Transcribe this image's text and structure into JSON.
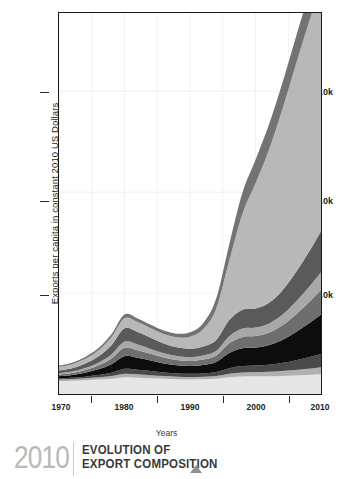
{
  "footer": {
    "year": "2010",
    "title_line1": "EVOLUTION OF",
    "title_line2": "EXPORT COMPOSITION",
    "marker": "triangle-up"
  },
  "chart_data": {
    "type": "area",
    "stacked": true,
    "title": "",
    "xlabel": "Years",
    "ylabel": "Exports per capita in constant 2010 US Dollars",
    "xlim": [
      1970,
      2010
    ],
    "ylim": [
      0,
      7550
    ],
    "grid": true,
    "legend": "none",
    "x_ticks": [
      "1970",
      "1980",
      "1990",
      "2000",
      "2010"
    ],
    "x_tick_values": [
      1970,
      1980,
      1990,
      2000,
      2010
    ],
    "x_minor_ticks": [
      1975,
      1985,
      1995,
      2005
    ],
    "y_ticks": [
      "2.0k",
      "4.0k",
      "6.0k"
    ],
    "y_tick_values": [
      2000,
      4000,
      6000
    ],
    "x": [
      1970,
      1972,
      1974,
      1976,
      1978,
      1980,
      1982,
      1984,
      1986,
      1988,
      1990,
      1992,
      1994,
      1996,
      1998,
      2000,
      2002,
      2004,
      2006,
      2008,
      2010
    ],
    "series": [
      {
        "name": "layer-1-bottom-light",
        "color": "#e6e6e6",
        "values": [
          255,
          262,
          272,
          285,
          300,
          330,
          322,
          312,
          300,
          292,
          288,
          290,
          300,
          330,
          345,
          350,
          352,
          358,
          368,
          378,
          392
        ]
      },
      {
        "name": "layer-2-mid-gray",
        "color": "#b0b0b0",
        "values": [
          30,
          33,
          38,
          45,
          55,
          72,
          68,
          62,
          56,
          52,
          50,
          52,
          58,
          72,
          80,
          84,
          88,
          96,
          108,
          122,
          140
        ]
      },
      {
        "name": "layer-3-dark-band",
        "color": "#4a4a4a",
        "values": [
          22,
          26,
          34,
          46,
          66,
          96,
          90,
          80,
          70,
          64,
          62,
          66,
          78,
          110,
          128,
          130,
          140,
          160,
          190,
          225,
          262
        ]
      },
      {
        "name": "layer-4-black",
        "color": "#0d0d0d",
        "values": [
          46,
          56,
          78,
          112,
          170,
          252,
          236,
          208,
          180,
          162,
          156,
          168,
          200,
          300,
          352,
          356,
          386,
          452,
          548,
          660,
          782
        ]
      },
      {
        "name": "layer-5-medium-gray",
        "color": "#6e6e6e",
        "values": [
          34,
          40,
          54,
          76,
          112,
          164,
          152,
          134,
          116,
          104,
          100,
          108,
          128,
          192,
          226,
          228,
          246,
          286,
          344,
          412,
          486
        ]
      },
      {
        "name": "layer-6-light-gray",
        "color": "#a8a8a8",
        "values": [
          26,
          30,
          40,
          56,
          82,
          120,
          112,
          98,
          86,
          78,
          74,
          80,
          94,
          142,
          166,
          168,
          182,
          210,
          252,
          300,
          352
        ]
      },
      {
        "name": "layer-7-dark-gray",
        "color": "#5a5a5a",
        "values": [
          52,
          62,
          86,
          122,
          182,
          268,
          250,
          220,
          192,
          172,
          166,
          178,
          212,
          318,
          372,
          378,
          408,
          476,
          572,
          686,
          812
        ]
      },
      {
        "name": "layer-8-dominant-pale",
        "color": "#b8b8b8",
        "values": [
          70,
          80,
          96,
          120,
          160,
          200,
          196,
          190,
          188,
          200,
          240,
          340,
          620,
          1180,
          1900,
          2480,
          3020,
          3560,
          4080,
          4520,
          4860
        ]
      },
      {
        "name": "layer-9-top-dark",
        "color": "#737373",
        "values": [
          28,
          31,
          36,
          44,
          56,
          72,
          70,
          68,
          68,
          72,
          86,
          120,
          200,
          330,
          420,
          470,
          500,
          520,
          540,
          555,
          570
        ]
      }
    ]
  }
}
